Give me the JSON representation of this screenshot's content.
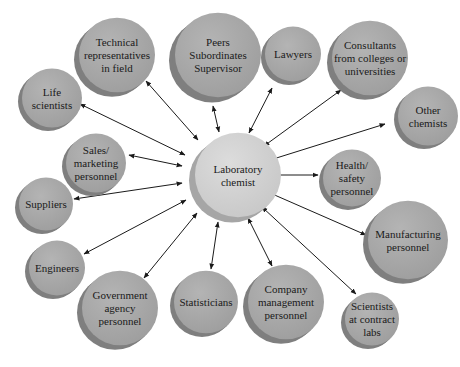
{
  "diagram": {
    "type": "hub-and-spoke",
    "colors": {
      "background": "#ffffff",
      "node_face": "#a9a9a9",
      "node_shadow": "#7f7f7f",
      "center_face": "#d3d3d3",
      "center_shadow": "#a6a6a6",
      "edge": "#1a1a1a",
      "text": "#1a1a1a"
    },
    "center": {
      "id": "laboratory-chemist",
      "lines": [
        "Laboratory",
        "chemist"
      ],
      "cx": 238,
      "cy": 175,
      "r": 43
    },
    "nodes": [
      {
        "id": "technical-representatives",
        "lines": [
          "Technical",
          "representatives",
          "in field"
        ],
        "cx": 117,
        "cy": 55,
        "r": 38
      },
      {
        "id": "peers-subordinates-supervisor",
        "lines": [
          "Peers",
          "Subordinates",
          "Supervisor"
        ],
        "cx": 218,
        "cy": 55,
        "r": 43
      },
      {
        "id": "lawyers",
        "lines": [
          "Lawyers"
        ],
        "cx": 293,
        "cy": 54,
        "r": 28
      },
      {
        "id": "consultants",
        "lines": [
          "Consultants",
          "from colleges or",
          "universities"
        ],
        "cx": 370,
        "cy": 58,
        "r": 38
      },
      {
        "id": "other-chemists",
        "lines": [
          "Other",
          "chemists"
        ],
        "cx": 428,
        "cy": 116,
        "r": 30
      },
      {
        "id": "life-scientists",
        "lines": [
          "Life",
          "scientists"
        ],
        "cx": 52,
        "cy": 98,
        "r": 30
      },
      {
        "id": "sales-marketing",
        "lines": [
          "Sales/",
          "marketing",
          "personnel"
        ],
        "cx": 96,
        "cy": 163,
        "r": 30
      },
      {
        "id": "health-safety",
        "lines": [
          "Health/",
          "safety",
          "personnel"
        ],
        "cx": 352,
        "cy": 178,
        "r": 29
      },
      {
        "id": "suppliers",
        "lines": [
          "Suppliers"
        ],
        "cx": 46,
        "cy": 204,
        "r": 27
      },
      {
        "id": "manufacturing",
        "lines": [
          "Manufacturing",
          "personnel"
        ],
        "cx": 408,
        "cy": 240,
        "r": 40
      },
      {
        "id": "engineers",
        "lines": [
          "Engineers"
        ],
        "cx": 57,
        "cy": 268,
        "r": 28
      },
      {
        "id": "government-agency",
        "lines": [
          "Government",
          "agency",
          "personnel"
        ],
        "cx": 120,
        "cy": 308,
        "r": 38
      },
      {
        "id": "statisticians",
        "lines": [
          "Statisticians"
        ],
        "cx": 206,
        "cy": 302,
        "r": 32
      },
      {
        "id": "company-management",
        "lines": [
          "Company",
          "management",
          "personnel"
        ],
        "cx": 286,
        "cy": 302,
        "r": 38
      },
      {
        "id": "scientists-contract-labs",
        "lines": [
          "Scientists",
          "at contract",
          "labs"
        ],
        "cx": 372,
        "cy": 319,
        "r": 27
      }
    ],
    "edges": [
      {
        "from": "laboratory-chemist",
        "to": "technical-representatives",
        "x1": 198,
        "y1": 140,
        "x2": 146,
        "y2": 81
      },
      {
        "from": "laboratory-chemist",
        "to": "peers-subordinates-supervisor",
        "x1": 219,
        "y1": 132,
        "x2": 213,
        "y2": 106
      },
      {
        "from": "laboratory-chemist",
        "to": "lawyers",
        "x1": 249,
        "y1": 133,
        "x2": 272,
        "y2": 88
      },
      {
        "from": "laboratory-chemist",
        "to": "consultants",
        "x1": 264,
        "y1": 146,
        "x2": 341,
        "y2": 90
      },
      {
        "from": "laboratory-chemist",
        "to": "other-chemists",
        "x1": 270,
        "y1": 160,
        "x2": 385,
        "y2": 124
      },
      {
        "from": "laboratory-chemist",
        "to": "life-scientists",
        "x1": 185,
        "y1": 155,
        "x2": 80,
        "y2": 104
      },
      {
        "from": "laboratory-chemist",
        "to": "sales-marketing",
        "x1": 182,
        "y1": 166,
        "x2": 129,
        "y2": 155
      },
      {
        "from": "laboratory-chemist",
        "to": "health-safety",
        "x1": 272,
        "y1": 175,
        "x2": 318,
        "y2": 175
      },
      {
        "from": "laboratory-chemist",
        "to": "suppliers",
        "x1": 182,
        "y1": 183,
        "x2": 74,
        "y2": 199
      },
      {
        "from": "laboratory-chemist",
        "to": "manufacturing",
        "x1": 270,
        "y1": 193,
        "x2": 366,
        "y2": 235
      },
      {
        "from": "laboratory-chemist",
        "to": "engineers",
        "x1": 186,
        "y1": 200,
        "x2": 84,
        "y2": 254
      },
      {
        "from": "laboratory-chemist",
        "to": "government-agency",
        "x1": 197,
        "y1": 213,
        "x2": 144,
        "y2": 278
      },
      {
        "from": "laboratory-chemist",
        "to": "statisticians",
        "x1": 218,
        "y1": 222,
        "x2": 211,
        "y2": 269
      },
      {
        "from": "laboratory-chemist",
        "to": "company-management",
        "x1": 248,
        "y1": 218,
        "x2": 272,
        "y2": 266
      },
      {
        "from": "laboratory-chemist",
        "to": "scientists-contract-labs",
        "x1": 262,
        "y1": 207,
        "x2": 356,
        "y2": 294
      }
    ]
  }
}
